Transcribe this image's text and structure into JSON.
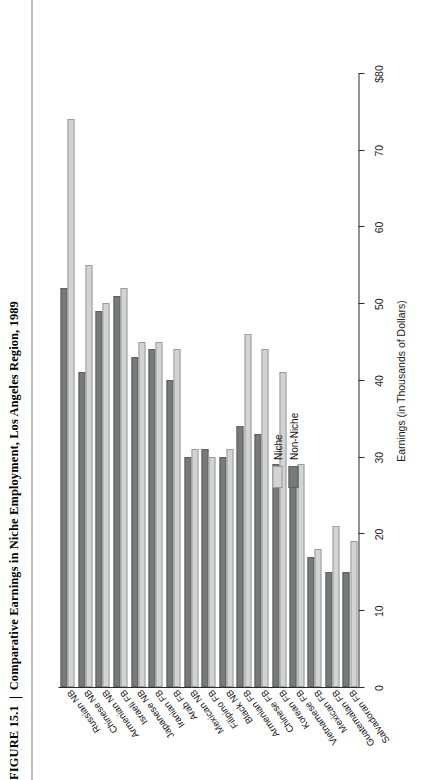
{
  "figure": {
    "number": "FIGURE 15.1",
    "separator": "|",
    "title": "Comparative Earnings in Niche Employment, Los Angeles Region, 1989"
  },
  "legend": {
    "items": [
      {
        "label": "Niche",
        "key": "niche",
        "color": "#d2d3d2"
      },
      {
        "label": "Non-Niche",
        "key": "nonniche",
        "color": "#787a79"
      }
    ]
  },
  "axes": {
    "value_axis_title": "Earnings (in Thousands of Dollars)",
    "tick_labels": [
      "$80",
      "70",
      "60",
      "50",
      "40",
      "30",
      "20",
      "10",
      "0"
    ],
    "tick_values": [
      80,
      70,
      60,
      50,
      40,
      30,
      20,
      10,
      0
    ],
    "value_min": 0,
    "value_max": 80
  },
  "chart_data": {
    "type": "bar",
    "orientation": "horizontal",
    "title": "Comparative Earnings in Niche Employment, Los Angeles Region, 1989",
    "xlabel": "Earnings (in Thousands of Dollars)",
    "ylabel": "",
    "xlim": [
      0,
      80
    ],
    "grid": false,
    "legend_position": "inside-left",
    "rotated_180": true,
    "categories": [
      "Russian NB",
      "Chinese NB",
      "Armenian NB",
      "Israeli FB",
      "Japanese NB",
      "Iranian FB",
      "Arab FB",
      "Mexican NB",
      "Filipino FB",
      "Black NB",
      "Armenian FB",
      "Chinese FB",
      "Korean FB",
      "Vietnamese FB",
      "Mexican FB",
      "Guatemalan FB",
      "Salvadoran FB"
    ],
    "series": [
      {
        "name": "Niche",
        "color": "#d2d3d2",
        "values": [
          74,
          55,
          50,
          52,
          45,
          45,
          44,
          31,
          30,
          31,
          46,
          44,
          41,
          29,
          18,
          21,
          19
        ]
      },
      {
        "name": "Non-Niche",
        "color": "#787a79",
        "values": [
          52,
          41,
          49,
          51,
          43,
          44,
          40,
          30,
          31,
          30,
          34,
          33,
          29,
          26,
          17,
          15,
          15
        ]
      }
    ]
  }
}
